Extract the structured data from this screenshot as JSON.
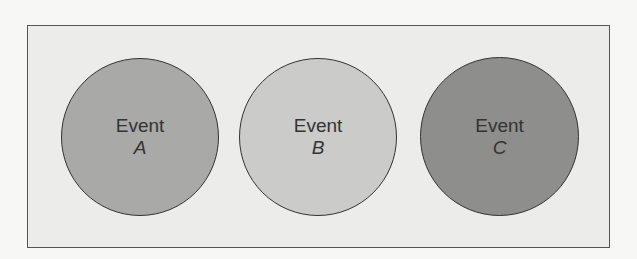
{
  "diagram": {
    "events": [
      {
        "label": "Event",
        "letter": "A",
        "fill": "#a9a9a7"
      },
      {
        "label": "Event",
        "letter": "B",
        "fill": "#cbcbc9"
      },
      {
        "label": "Event",
        "letter": "C",
        "fill": "#8e8e8c"
      }
    ]
  }
}
